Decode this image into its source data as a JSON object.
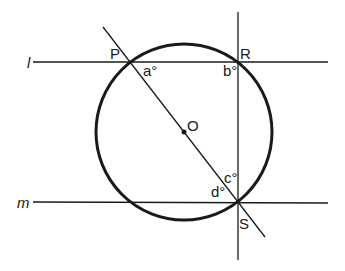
{
  "diagram": {
    "lines": {
      "l": "l",
      "m": "m"
    },
    "points": {
      "P": "P",
      "R": "R",
      "S": "S",
      "O": "O"
    },
    "angles": {
      "a": "a°",
      "b": "b°",
      "c": "c°",
      "d": "d°"
    },
    "colors": {
      "stroke": "#1a1a1a",
      "background": "#ffffff"
    }
  }
}
